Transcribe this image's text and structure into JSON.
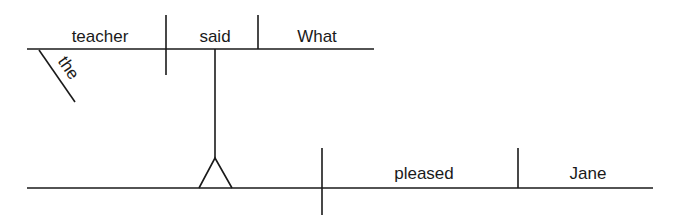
{
  "diagram": {
    "type": "sentence-diagram",
    "main_clause": {
      "subject": "teacher",
      "subject_modifier": "the",
      "verb": "said",
      "object": "What"
    },
    "subordinate_clause": {
      "verb": "pleased",
      "object": "Jane"
    },
    "colors": {
      "line": "#1a1a1a",
      "text": "#1a1a1a",
      "background": "#ffffff"
    }
  }
}
